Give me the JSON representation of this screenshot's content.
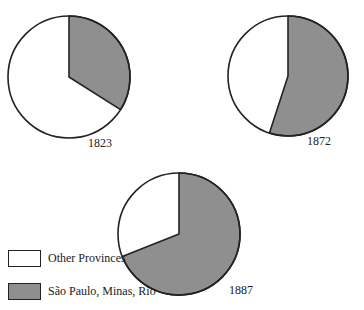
{
  "chart_data": [
    {
      "type": "pie",
      "title": "1823",
      "labels": [
        "São Paulo, Minas, Rio",
        "Other Provinces"
      ],
      "values": [
        34,
        66
      ],
      "colors": [
        "#8f8f8f",
        "#ffffff"
      ],
      "start": "12 o'clock, clockwise"
    },
    {
      "type": "pie",
      "title": "1872",
      "labels": [
        "São Paulo, Minas, Rio",
        "Other Provinces"
      ],
      "values": [
        55,
        45
      ],
      "colors": [
        "#8f8f8f",
        "#ffffff"
      ],
      "start": "12 o'clock, clockwise"
    },
    {
      "type": "pie",
      "title": "1887",
      "labels": [
        "São Paulo, Minas, Rio",
        "Other Provinces"
      ],
      "values": [
        69,
        31
      ],
      "colors": [
        "#8f8f8f",
        "#ffffff"
      ],
      "start": "12 o'clock, clockwise"
    }
  ],
  "pies": [
    {
      "year": "1823",
      "cx": 69,
      "cy": 77,
      "r": 61,
      "shaded_pct": 34
    },
    {
      "year": "1872",
      "cx": 288,
      "cy": 76,
      "r": 60,
      "shaded_pct": 55
    },
    {
      "year": "1887",
      "cx": 179,
      "cy": 234,
      "r": 61,
      "shaded_pct": 69
    }
  ],
  "legend": {
    "items": [
      {
        "label": "Other Provinces",
        "color": "#ffffff"
      },
      {
        "label": "São Paulo, Minas, Rio",
        "color": "#8f8f8f"
      }
    ]
  },
  "colors": {
    "shaded": "#8f8f8f",
    "unshaded": "#ffffff",
    "stroke": "#222222"
  }
}
